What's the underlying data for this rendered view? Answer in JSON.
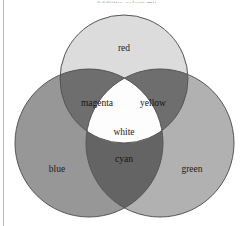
{
  "figure": {
    "title_sliver": "Additive colour mixing",
    "type": "venn-diagram",
    "background_color": "#ffffff",
    "margin_rule_color": "#b9b9b9",
    "outline_color": "#555555"
  },
  "diagram": {
    "circles": [
      {
        "id": "red",
        "label": "red",
        "cx": 124,
        "cy": 79,
        "r": 64,
        "fill": "#dcdcdc",
        "label_x": 124,
        "label_y": 49
      },
      {
        "id": "blue",
        "label": "blue",
        "cx": 89,
        "cy": 143,
        "r": 74,
        "fill": "#979797",
        "label_x": 57,
        "label_y": 170
      },
      {
        "id": "green",
        "label": "green",
        "cx": 160,
        "cy": 143,
        "r": 74,
        "fill": "#b1b1b1",
        "label_x": 192,
        "label_y": 170
      }
    ],
    "intersections": [
      {
        "id": "magenta",
        "label": "magenta",
        "of": [
          "red",
          "blue"
        ],
        "fill": "#6e6e6e",
        "label_x": 97,
        "label_y": 104
      },
      {
        "id": "yellow",
        "label": "yellow",
        "of": [
          "red",
          "green"
        ],
        "fill": "#6e6e6e",
        "label_x": 153,
        "label_y": 104
      },
      {
        "id": "cyan",
        "label": "cyan",
        "of": [
          "blue",
          "green"
        ],
        "fill": "#646464",
        "label_x": 124,
        "label_y": 160
      },
      {
        "id": "white",
        "label": "white",
        "of": [
          "red",
          "blue",
          "green"
        ],
        "fill": "#fdfdfd",
        "label_x": 124,
        "label_y": 133
      }
    ]
  }
}
